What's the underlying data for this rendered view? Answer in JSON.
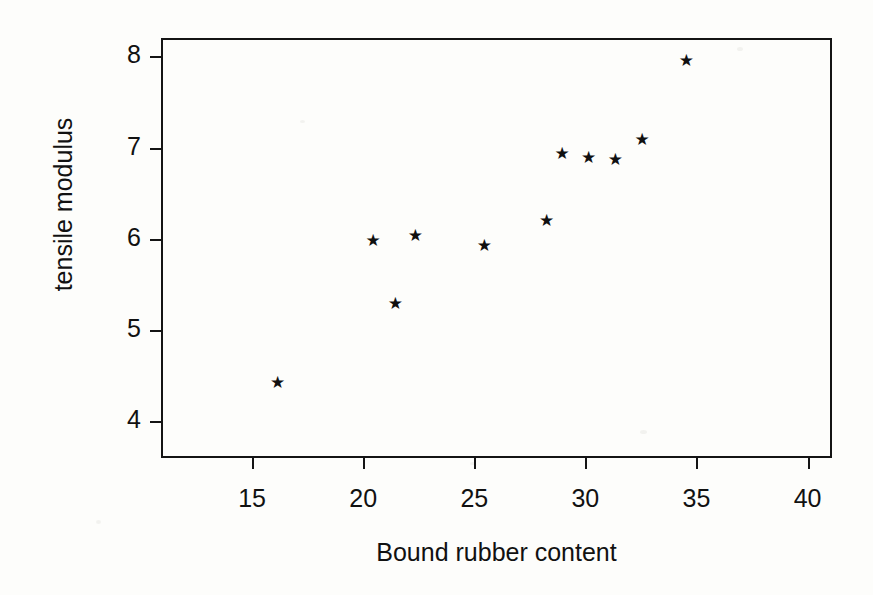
{
  "chart_data": {
    "type": "scatter",
    "title": "",
    "xlabel": "Bound rubber content",
    "ylabel": "tensile modulus",
    "xlim": [
      10.9,
      41.1
    ],
    "ylim": [
      3.6,
      8.2
    ],
    "xticks": [
      15,
      20,
      25,
      30,
      35,
      40
    ],
    "yticks": [
      4,
      5,
      6,
      7,
      8
    ],
    "xtick_labels": [
      "15",
      "20",
      "25",
      "30",
      "35",
      "40"
    ],
    "ytick_labels": [
      "4",
      "5",
      "6",
      "7",
      "8"
    ],
    "grid": false,
    "legend": null,
    "marker": "star",
    "marker_glyph": "★",
    "marker_color": "#101010",
    "frame_color": "#141414",
    "background_color": "#fdfdfb",
    "points": [
      {
        "x": 16.1,
        "y": 4.42
      },
      {
        "x": 20.4,
        "y": 5.97
      },
      {
        "x": 21.4,
        "y": 5.28
      },
      {
        "x": 22.3,
        "y": 6.03
      },
      {
        "x": 25.4,
        "y": 5.92
      },
      {
        "x": 28.2,
        "y": 6.19
      },
      {
        "x": 28.9,
        "y": 6.92
      },
      {
        "x": 30.1,
        "y": 6.88
      },
      {
        "x": 31.3,
        "y": 6.86
      },
      {
        "x": 32.5,
        "y": 7.08
      },
      {
        "x": 34.5,
        "y": 7.94
      }
    ],
    "x": [
      16.1,
      20.4,
      21.4,
      22.3,
      25.4,
      28.2,
      28.9,
      30.1,
      31.3,
      32.5,
      34.5
    ],
    "values": [
      4.42,
      5.97,
      5.28,
      6.03,
      5.92,
      6.19,
      6.92,
      6.88,
      6.86,
      7.08,
      7.94
    ]
  }
}
